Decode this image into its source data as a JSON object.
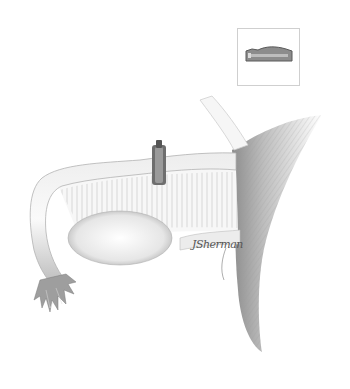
{
  "illustration": {
    "subject": "Fallopian tube with occlusion clip applied, ovary and uterine cornu",
    "inset": {
      "subject": "Clip device detail"
    },
    "signature": "JSherman",
    "colors": {
      "background": "#ffffff",
      "tissue_light": "#f2f2f2",
      "tissue_mid": "#c8c8c8",
      "tissue_dark": "#8a8a8a",
      "clip": "#6e6e6e",
      "inset_border": "#cfcfcf"
    }
  }
}
